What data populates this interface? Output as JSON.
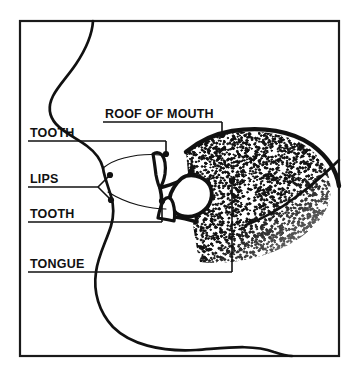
{
  "figure": {
    "frame": {
      "x": 20,
      "y": 21,
      "width": 319,
      "height": 335,
      "stroke_color": "#1a1a1a",
      "stroke_width": 2.2,
      "fill_color": "#ffffff"
    },
    "ink_color": "#111111",
    "background_color": "#ffffff",
    "labels": [
      {
        "id": "roof-of-mouth",
        "text": "ROOF OF MOUTH",
        "text_x": 105,
        "text_y": 118,
        "underline": {
          "x1": 103,
          "y1": 122,
          "x2": 222,
          "y2": 122
        },
        "leaders": [
          {
            "points": "222,122 222,133",
            "dot_x": 222,
            "dot_y": 135
          }
        ]
      },
      {
        "id": "tooth-upper",
        "text": "TOOTH",
        "text_x": 30,
        "text_y": 137,
        "underline": {
          "x1": 28,
          "y1": 141,
          "x2": 166,
          "y2": 141
        },
        "leaders": [
          {
            "points": "166,141 166,152",
            "dot_x": 166,
            "dot_y": 154
          }
        ]
      },
      {
        "id": "lips",
        "text": "LIPS",
        "text_x": 30,
        "text_y": 183,
        "underline": {
          "x1": 28,
          "y1": 187,
          "x2": 98,
          "y2": 187
        },
        "leaders": [
          {
            "points": "98,187 109,176",
            "dot_x": 110,
            "dot_y": 175
          },
          {
            "points": "98,187 110,199",
            "dot_x": 111,
            "dot_y": 200
          }
        ]
      },
      {
        "id": "tooth-lower",
        "text": "TOOTH",
        "text_x": 30,
        "text_y": 218,
        "underline": {
          "x1": 28,
          "y1": 222,
          "x2": 162,
          "y2": 222
        },
        "leaders": [
          {
            "points": "162,222 162,203",
            "dot_x": 162,
            "dot_y": 201
          }
        ]
      },
      {
        "id": "tongue",
        "text": "TONGUE",
        "text_x": 30,
        "text_y": 268,
        "underline": {
          "x1": 28,
          "y1": 272,
          "x2": 232,
          "y2": 272
        },
        "leaders": [
          {
            "points": "232,272 232,183",
            "dot_x": 232,
            "dot_y": 181
          }
        ]
      }
    ],
    "anatomy": {
      "face_profile_name": "face-profile-outline",
      "face_profile_path": "M 93 21 C 92 38, 84 52, 76 64 C 68 76, 58 86, 53 96 C 48 106, 49 116, 56 124 C 63 132, 76 138, 87 146 C 95 152, 101 160, 103 168",
      "jaw_path": "M 103 168 C 104 176, 108 186, 111 196 C 114 206, 114 216, 111 226 C 106 242, 98 256, 96 272 C 93 292, 99 312, 113 327 C 130 344, 160 352, 196 350 C 226 348, 252 344, 274 352 C 283 355, 289 356, 292 356",
      "upper_lip_path": "M 103 168 C 108 164, 116 160, 124 158 C 136 155, 150 154, 160 155",
      "lower_lip_path": "M 108 192 C 116 197, 126 202, 138 205 C 150 208, 160 209, 166 209",
      "upper_teeth_path": "M 153 154 C 156 152, 159 152, 162 155 C 165 159, 166 166, 165 174 C 164 180, 162 185, 160 188 C 158 185, 157 180, 156 175 C 155 167, 154 159, 153 154 Z",
      "lower_teeth_path": "M 158 218 C 159 212, 161 205, 164 200 C 167 196, 171 197, 173 203 C 175 210, 175 216, 174 221 C 170 220, 164 219, 158 218 Z",
      "palate_outline_path": "M 186 152 C 198 142, 214 134, 232 131 C 262 126, 292 131, 312 145 C 328 157, 337 172, 339 186",
      "pharynx_path": "M 339 160 C 327 172, 312 185, 296 197 C 280 209, 262 219, 246 225",
      "tongue_body_path": "M 186 152 C 196 144, 212 136, 232 133 C 262 129, 292 135, 310 149 C 326 162, 333 180, 330 198 C 326 218, 308 236, 282 248 C 256 260, 226 265, 200 262 C 196 248, 194 232, 192 216 C 190 196, 188 172, 186 152 Z",
      "mouth_cavity_path": "M 160 188 C 166 186, 174 184, 182 180 C 188 177, 192 172, 192 166 C 192 176, 193 188, 194 198 C 195 208, 196 216, 197 222 C 190 220, 182 218, 175 217 C 170 216, 164 216, 160 217 C 162 208, 162 196, 160 188 Z",
      "tongue_tip_path": "M 186 176 C 196 174, 206 178, 210 186 C 214 195, 211 206, 202 212 C 194 218, 183 218, 176 213 C 170 208, 168 200, 171 193 C 174 186, 180 178, 186 176 Z",
      "stipple": {
        "name": "tongue-stipple-texture",
        "dot_color": "#111111",
        "description": "dense random dot shading filling the tongue body, fading toward the lower right"
      }
    }
  }
}
